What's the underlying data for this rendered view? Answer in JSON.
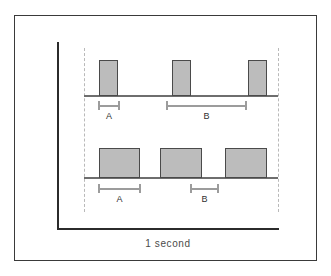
{
  "figure": {
    "axis_caption": "1 second",
    "colors": {
      "pulse_fill": "#bcbcbc",
      "pulse_stroke": "#4a4a4a",
      "baseline": "#6e6e6e",
      "axis": "#2b2b2b",
      "guide": "#b9b9b9",
      "bracket": "#9c9c9c",
      "frame": "#3a3a3a",
      "background": "#ffffff"
    }
  },
  "chart_data": {
    "type": "line",
    "xlabel": "1 second",
    "ylabel": "",
    "grid": false,
    "legend": "none",
    "series": [
      {
        "name": "narrow-duty-cycle-waveform",
        "row": "top",
        "pulse_count": 3,
        "pulses": [
          {
            "start": 0.077,
            "end": 0.175,
            "height": 1
          },
          {
            "start": 0.454,
            "end": 0.552,
            "height": 1
          },
          {
            "start": 0.845,
            "end": 0.943,
            "height": 1
          }
        ],
        "measurements": [
          {
            "label": "A",
            "meaning": "pulse width",
            "start": 0.077,
            "end": 0.175
          },
          {
            "label": "B",
            "meaning": "gap between pulses",
            "start": 0.422,
            "end": 0.84
          }
        ]
      },
      {
        "name": "wide-duty-cycle-waveform",
        "row": "bottom",
        "pulse_count": 3,
        "pulses": [
          {
            "start": 0.077,
            "end": 0.289,
            "height": 1
          },
          {
            "start": 0.392,
            "end": 0.608,
            "height": 1
          },
          {
            "start": 0.727,
            "end": 0.943,
            "height": 1
          }
        ],
        "measurements": [
          {
            "label": "A",
            "meaning": "pulse width",
            "start": 0.077,
            "end": 0.289
          },
          {
            "label": "B",
            "meaning": "gap between pulses",
            "start": 0.546,
            "end": 0.691
          }
        ]
      }
    ],
    "xlim": [
      0,
      1
    ],
    "ylim": [
      0,
      1
    ]
  },
  "top_waveform": {
    "pulses": [
      {
        "left": 99,
        "top": 60,
        "width": 19,
        "height": 36
      },
      {
        "left": 172,
        "top": 60,
        "width": 19,
        "height": 36
      },
      {
        "left": 248,
        "top": 60,
        "width": 19,
        "height": 36
      }
    ],
    "brackets": [
      {
        "label": "A",
        "left": 98,
        "top": 101,
        "width": 22
      },
      {
        "label": "B",
        "left": 166,
        "top": 101,
        "width": 81
      }
    ]
  },
  "bottom_waveform": {
    "pulses": [
      {
        "left": 99,
        "top": 148,
        "width": 41,
        "height": 30
      },
      {
        "left": 160,
        "top": 148,
        "width": 42,
        "height": 30
      },
      {
        "left": 225,
        "top": 148,
        "width": 42,
        "height": 30
      }
    ],
    "brackets": [
      {
        "label": "A",
        "left": 98,
        "top": 184,
        "width": 43
      },
      {
        "label": "B",
        "left": 190,
        "top": 184,
        "width": 29
      }
    ]
  },
  "labels": {
    "top_a": "A",
    "top_b": "B",
    "bottom_a": "A",
    "bottom_b": "B",
    "axis_caption": "1 second"
  }
}
